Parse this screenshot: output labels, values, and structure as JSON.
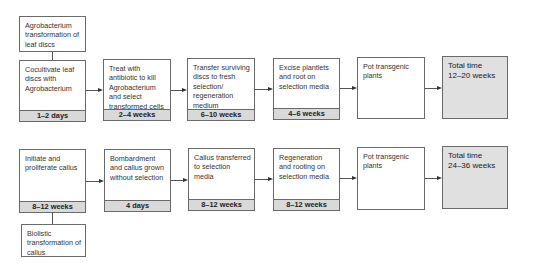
{
  "diagram": {
    "rows": [
      {
        "origin_label": "Agrobacterium transformation of leaf discs",
        "steps": [
          {
            "text": "Cocultivate leaf discs with Agrobacterium",
            "duration": "1–2 days"
          },
          {
            "text": "Treat with antibiotic to kill Agrobacterium and select transformed cells",
            "duration": "2–4 weeks"
          },
          {
            "text": "Transfer surviving discs to fresh selection/ regeneration medium",
            "duration": "6–10 weeks"
          },
          {
            "text": "Excise plantlets and root on selection media",
            "duration": "4–6 weeks"
          },
          {
            "text": "Pot transgenic plants",
            "duration": ""
          }
        ],
        "total": {
          "label": "Total time",
          "value": "12–20 weeks"
        }
      },
      {
        "origin_label": "Biolistic transformation of callus",
        "steps": [
          {
            "text": "Initiate and proliferate callus",
            "duration": "8–12 weeks"
          },
          {
            "text": "Bombardment and callus grown without selection",
            "duration": "4 days"
          },
          {
            "text": "Callus transferred to selection media",
            "duration": "8–12 weeks"
          },
          {
            "text": "Regeneration and rooting on selection media",
            "duration": "8–12 weeks"
          },
          {
            "text": "Pot transgenic plants",
            "duration": ""
          }
        ],
        "total": {
          "label": "Total time",
          "value": "24–36 weeks"
        }
      }
    ]
  }
}
